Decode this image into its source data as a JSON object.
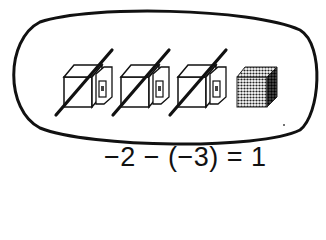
{
  "diagram": {
    "group_outline": "oval",
    "cubes": [
      {
        "kind": "negative",
        "crossed_out": true
      },
      {
        "kind": "negative",
        "crossed_out": true
      },
      {
        "kind": "negative",
        "crossed_out": true
      },
      {
        "kind": "positive",
        "crossed_out": false
      }
    ],
    "equation": "−2 − (−3) = 1",
    "colors": {
      "ink": "#111111",
      "positive_fill": "#3a3a3a",
      "background": "#ffffff"
    }
  }
}
